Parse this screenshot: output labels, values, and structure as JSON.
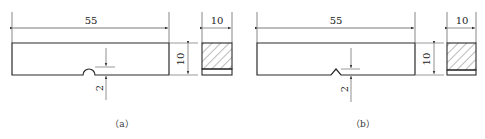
{
  "figure": {
    "panel_a": {
      "caption": "（a）",
      "notch_type": "U-notch",
      "length_label": "55",
      "height_label": "10",
      "notch_depth_label": "2",
      "section_width_label": "10"
    },
    "panel_b": {
      "caption": "（b）",
      "notch_type": "V-notch",
      "length_label": "55",
      "height_label": "10",
      "notch_depth_label": "2",
      "section_width_label": "10"
    }
  },
  "colors": {
    "line": "#2a2a2a",
    "dim_line": "#444444",
    "background": "#ffffff"
  }
}
